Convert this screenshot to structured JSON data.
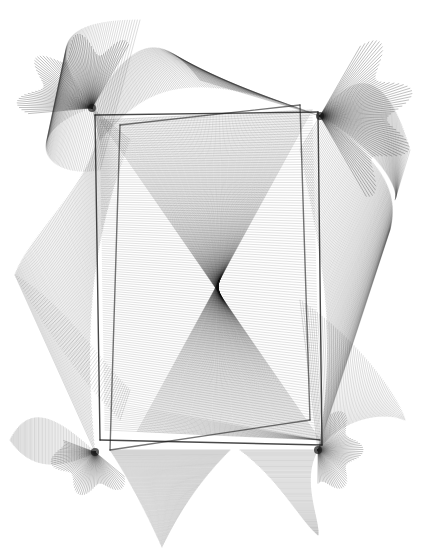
{
  "artwork": {
    "title": "",
    "background": "#ffffff",
    "ink": "#1a1a1a",
    "width": 422,
    "height": 557,
    "fans": [
      {
        "name": "fan-top-left",
        "cx": 92,
        "cy": 108,
        "r": 75,
        "a0": 175,
        "a1": 300,
        "n": 70,
        "opacity": 0.55
      },
      {
        "name": "fan-top-right",
        "cx": 320,
        "cy": 116,
        "r": 95,
        "a0": -60,
        "a1": 60,
        "n": 70,
        "opacity": 0.55
      },
      {
        "name": "fan-bottom-left",
        "cx": 95,
        "cy": 452,
        "r": 45,
        "a0": 40,
        "a1": 200,
        "n": 60,
        "opacity": 0.5
      },
      {
        "name": "fan-bottom-right",
        "cx": 318,
        "cy": 450,
        "r": 45,
        "a0": -70,
        "a1": 90,
        "n": 60,
        "opacity": 0.5
      }
    ],
    "ribbons": [
      {
        "name": "ribbon-top-peak",
        "a": [
          [
            92,
            108
          ],
          [
            130,
            40
          ],
          [
            160,
            28
          ],
          [
            200,
            80
          ]
        ],
        "b": [
          [
            100,
            140
          ],
          [
            140,
            95
          ],
          [
            175,
            60
          ],
          [
            320,
            116
          ]
        ],
        "n": 110,
        "opacity": 0.35
      },
      {
        "name": "ribbon-top-left-swoop",
        "a": [
          [
            92,
            108
          ],
          [
            40,
            40
          ],
          [
            70,
            20
          ],
          [
            140,
            20
          ]
        ],
        "b": [
          [
            92,
            108
          ],
          [
            20,
            130
          ],
          [
            40,
            180
          ],
          [
            100,
            170
          ]
        ],
        "n": 80,
        "opacity": 0.3
      },
      {
        "name": "ribbon-top-right-swoop",
        "a": [
          [
            320,
            116
          ],
          [
            360,
            60
          ],
          [
            390,
            80
          ],
          [
            410,
            150
          ]
        ],
        "b": [
          [
            320,
            116
          ],
          [
            380,
            150
          ],
          [
            400,
            190
          ],
          [
            395,
            200
          ]
        ],
        "n": 80,
        "opacity": 0.3
      },
      {
        "name": "ribbon-left",
        "a": [
          [
            92,
            108
          ],
          [
            120,
            160
          ],
          [
            30,
            230
          ],
          [
            15,
            275
          ]
        ],
        "b": [
          [
            130,
            140
          ],
          [
            100,
            220
          ],
          [
            80,
            300
          ],
          [
            95,
            452
          ]
        ],
        "n": 120,
        "opacity": 0.32
      },
      {
        "name": "ribbon-right",
        "a": [
          [
            320,
            116
          ],
          [
            380,
            160
          ],
          [
            400,
            190
          ],
          [
            390,
            230
          ]
        ],
        "b": [
          [
            300,
            150
          ],
          [
            320,
            250
          ],
          [
            340,
            330
          ],
          [
            318,
            450
          ]
        ],
        "n": 120,
        "opacity": 0.32
      },
      {
        "name": "ribbon-right-lower",
        "a": [
          [
            300,
            300
          ],
          [
            360,
            340
          ],
          [
            400,
            400
          ],
          [
            405,
            420
          ]
        ],
        "b": [
          [
            318,
            450
          ],
          [
            340,
            420
          ],
          [
            380,
            410
          ],
          [
            405,
            420
          ]
        ],
        "n": 70,
        "opacity": 0.3
      },
      {
        "name": "ribbon-left-lower",
        "a": [
          [
            95,
            452
          ],
          [
            60,
            420
          ],
          [
            30,
            400
          ],
          [
            10,
            440
          ]
        ],
        "b": [
          [
            95,
            452
          ],
          [
            60,
            470
          ],
          [
            30,
            470
          ],
          [
            10,
            440
          ]
        ],
        "n": 60,
        "opacity": 0.35
      },
      {
        "name": "ribbon-bottom",
        "a": [
          [
            110,
            450
          ],
          [
            130,
            480
          ],
          [
            150,
            520
          ],
          [
            162,
            547
          ]
        ],
        "b": [
          [
            230,
            450
          ],
          [
            200,
            480
          ],
          [
            180,
            510
          ],
          [
            162,
            547
          ]
        ],
        "n": 100,
        "opacity": 0.35
      },
      {
        "name": "ribbon-bottom-right",
        "a": [
          [
            240,
            450
          ],
          [
            280,
            480
          ],
          [
            300,
            520
          ],
          [
            318,
            535
          ]
        ],
        "b": [
          [
            318,
            450
          ],
          [
            300,
            480
          ],
          [
            320,
            520
          ],
          [
            318,
            535
          ]
        ],
        "n": 80,
        "opacity": 0.35
      },
      {
        "name": "ribbon-bottom-left-tail",
        "a": [
          [
            15,
            275
          ],
          [
            60,
            300
          ],
          [
            100,
            360
          ],
          [
            130,
            390
          ]
        ],
        "b": [
          [
            15,
            275
          ],
          [
            40,
            320
          ],
          [
            80,
            380
          ],
          [
            120,
            420
          ]
        ],
        "n": 60,
        "opacity": 0.28
      }
    ],
    "mesh": {
      "name": "central-mesh",
      "corners": [
        [
          100,
          120
        ],
        [
          312,
          110
        ],
        [
          320,
          440
        ],
        [
          105,
          430
        ]
      ],
      "n": 140,
      "opacity": 0.28
    },
    "frames": [
      {
        "name": "frame-inner",
        "points": [
          [
            95,
            115
          ],
          [
            318,
            112
          ],
          [
            322,
            445
          ],
          [
            100,
            440
          ]
        ],
        "opacity": 0.8
      },
      {
        "name": "frame-tilted",
        "points": [
          [
            120,
            125
          ],
          [
            300,
            105
          ],
          [
            310,
            420
          ],
          [
            110,
            450
          ]
        ],
        "opacity": 0.6
      }
    ]
  }
}
